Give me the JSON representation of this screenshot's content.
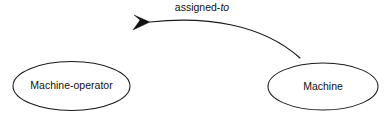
{
  "diagram": {
    "type": "entity-relationship",
    "background_color": "#ffffff",
    "line_color": "#1a1a1a",
    "text_color": "#111111",
    "nodes": [
      {
        "id": "machine-operator",
        "label": "Machine-operator",
        "shape": "ellipse",
        "cx": 71.5,
        "cy": 86,
        "rx": 58.5,
        "ry": 24.5
      },
      {
        "id": "machine",
        "label": "Machine",
        "shape": "ellipse",
        "cx": 323,
        "cy": 86.5,
        "rx": 55,
        "ry": 23.5
      }
    ],
    "edges": [
      {
        "id": "assigned-to-edge",
        "from": "machine",
        "to": "machine-operator",
        "label_main": "assigned-",
        "label_italic": "to",
        "label_full": "assigned-to",
        "label_x": 202,
        "label_y": 11,
        "arrow_direction": "points-to-machine-operator",
        "curve": "M 300 58 C 262 24, 206 16, 150 22",
        "arrow_points": "150,22 133,30 140,20 134,15"
      }
    ]
  }
}
